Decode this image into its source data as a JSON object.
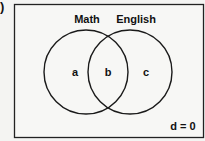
{
  "figure": {
    "corner_mark": ")",
    "universe": {
      "x": 14,
      "y": 4,
      "width": 190,
      "height": 134,
      "stroke": "#222"
    },
    "sets": [
      {
        "name": "Math",
        "label": "Math",
        "cx": 86,
        "cy": 72,
        "r": 42,
        "label_x": 87,
        "label_y": 23
      },
      {
        "name": "English",
        "label": "English",
        "cx": 130,
        "cy": 72,
        "r": 42,
        "label_x": 136,
        "label_y": 23
      }
    ],
    "regions": [
      {
        "id": "a",
        "label": "a",
        "x": 75,
        "y": 76
      },
      {
        "id": "b",
        "label": "b",
        "x": 108,
        "y": 76
      },
      {
        "id": "c",
        "label": "c",
        "x": 146,
        "y": 76
      }
    ],
    "outside": {
      "label": "d = 0",
      "x": 183,
      "y": 130
    }
  }
}
